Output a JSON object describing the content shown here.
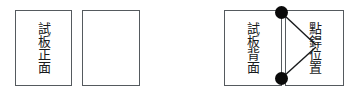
{
  "diagram": {
    "canvas": {
      "width": 352,
      "height": 96,
      "background": "#ffffff"
    },
    "stroke_color": "#555a5e",
    "text_color": "#17191b",
    "marker_color": "#0a0a0a",
    "panels": [
      {
        "name": "test-plate-front",
        "label": "試板正面",
        "x": 15,
        "y": 10,
        "width": 57,
        "height": 76
      },
      {
        "name": "blank-plate",
        "label": "",
        "x": 82,
        "y": 10,
        "width": 58,
        "height": 76
      },
      {
        "name": "test-plate-back",
        "label": "試板背面",
        "x": 224,
        "y": 10,
        "width": 58,
        "height": 76
      },
      {
        "name": "spot-weld-location",
        "label": "點銲位置",
        "x": 285,
        "y": 10,
        "width": 59,
        "height": 76
      }
    ],
    "markers": [
      {
        "name": "spot-weld-marker-top",
        "cx": 281.5,
        "cy": 12.5,
        "r": 6.5
      },
      {
        "name": "spot-weld-marker-bottom",
        "cx": 281.5,
        "cy": 78.5,
        "r": 6.5
      }
    ],
    "leaders": [
      {
        "name": "leader-line-top",
        "x1": 284,
        "y1": 15,
        "x2": 316,
        "y2": 45
      },
      {
        "name": "leader-line-bottom",
        "x1": 284,
        "y1": 76,
        "x2": 316,
        "y2": 47
      }
    ]
  }
}
